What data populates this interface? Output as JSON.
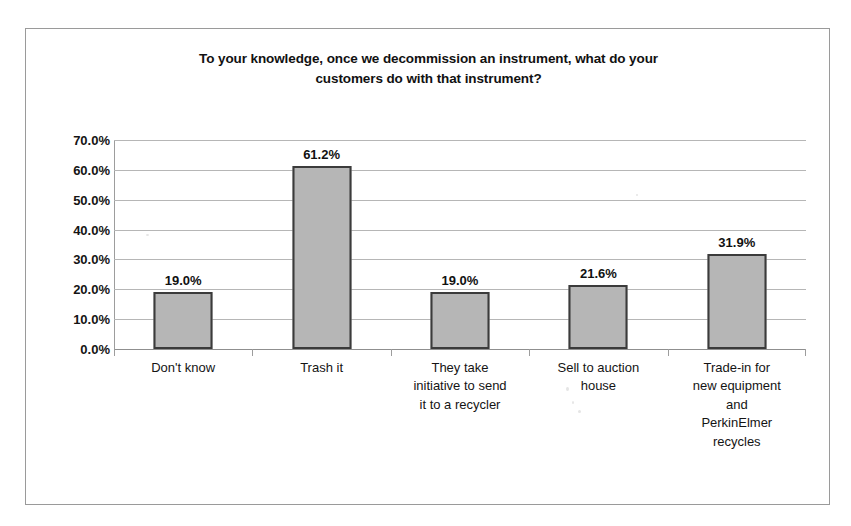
{
  "chart_data": {
    "type": "bar",
    "title": "To your knowledge, once we decommission an instrument, what do your customers do with that instrument?",
    "title_lines": [
      "To your knowledge, once we decommission an instrument, what do your",
      "customers do with that instrument?"
    ],
    "xlabel": "",
    "ylabel": "",
    "ylim": [
      0,
      70
    ],
    "ytick_labels": [
      "70.0%",
      "60.0%",
      "50.0%",
      "40.0%",
      "30.0%",
      "20.0%",
      "10.0%",
      "0.0%"
    ],
    "ytick_values": [
      70,
      60,
      50,
      40,
      30,
      20,
      10,
      0
    ],
    "grid": true,
    "legend": false,
    "categories": [
      "Don't know",
      "Trash it",
      "They take initiative to send it to a recycler",
      "Sell to auction house",
      "Trade-in for new equipment and PerkinElmer recycles"
    ],
    "category_lines": [
      [
        "Don't know"
      ],
      [
        "Trash it"
      ],
      [
        "They take",
        "initiative to send",
        "it to a recycler"
      ],
      [
        "Sell to auction",
        "house"
      ],
      [
        "Trade-in for",
        "new equipment",
        "and",
        "PerkinElmer",
        "recycles"
      ]
    ],
    "values": [
      19.0,
      61.2,
      19.0,
      21.6,
      31.9
    ],
    "data_labels": [
      "19.0%",
      "61.2%",
      "19.0%",
      "21.6%",
      "31.9%"
    ],
    "colors": {
      "bar_fill": "#a9a9a9",
      "bar_border": "#3b3b3b",
      "gridline": "#b6b6b6",
      "axis": "#9d9d9d",
      "text": "#141414",
      "frame": "#9a9a9a",
      "background": "#ffffff"
    }
  }
}
